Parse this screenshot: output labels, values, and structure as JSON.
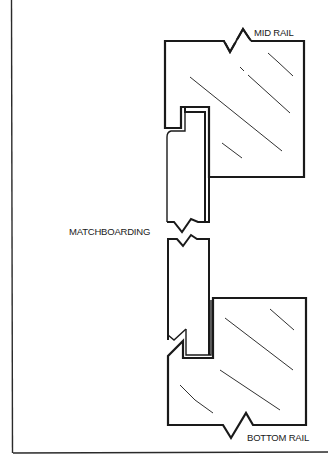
{
  "figure": {
    "type": "cross-section joinery diagram",
    "stroke_color": "#1a1a1a",
    "background": "#ffffff"
  },
  "labels": {
    "mid_rail": "MID RAIL",
    "matchboarding": "MATCHBOARDING",
    "bottom_rail": "BOTTOM RAIL"
  },
  "parts": [
    {
      "name": "mid-rail",
      "description": "upper rail section with groove, hatched, broken top edge"
    },
    {
      "name": "matchboarding",
      "description": "vertical tongued board, broken in middle"
    },
    {
      "name": "bottom-rail",
      "description": "lower rail section with groove and weathered lip, hatched, broken bottom edge"
    }
  ]
}
